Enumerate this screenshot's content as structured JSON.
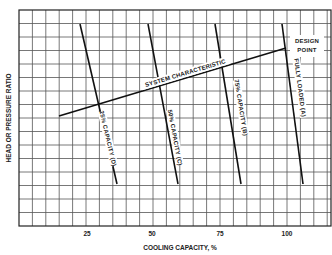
{
  "chart_data": {
    "type": "line",
    "title": "",
    "xlabel": "COOLING CAPACITY, %",
    "ylabel": "HEAD OR PRESSURE RATIO",
    "x_ticks": [
      "25",
      "50",
      "75",
      "100"
    ],
    "xlim": [
      0,
      115
    ],
    "grid": true,
    "series": [
      {
        "name": "25% CAPACITY (D)",
        "points": [
          [
            -1,
            24
          ],
          [
            35,
            184
          ]
        ]
      },
      {
        "name": "50% CAPACITY (C)",
        "points": [
          [
            48,
            24
          ],
          [
            61,
            184
          ]
        ]
      },
      {
        "name": "75% CAPACITY (B)",
        "points": [
          [
            73,
            24
          ],
          [
            83,
            184
          ]
        ]
      },
      {
        "name": "FULLY LOADED (A)",
        "points": [
          [
            98,
            24
          ],
          [
            106,
            184
          ]
        ]
      },
      {
        "name": "SYSTEM CHARACTERISTIC",
        "points": [
          [
            15,
            116
          ],
          [
            100,
            48
          ]
        ]
      }
    ],
    "annotations": [
      "DESIGN POINT"
    ]
  },
  "labels": {
    "system": "SYSTEM CHARACTERISTIC",
    "design_line1": "DESIGN",
    "design_line2": "POINT",
    "cap25": "25% CAPACITY (D)",
    "cap50": "50% CAPACITY (C)",
    "cap75": "75% CAPACITY (B)",
    "full": "FULLY LOADED (A)",
    "xlabel": "COOLING CAPACITY, %",
    "ylabel": "HEAD OR PRESSURE RATIO",
    "tick25": "25",
    "tick50": "50",
    "tick75": "75",
    "tick100": "100"
  }
}
